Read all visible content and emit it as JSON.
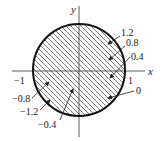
{
  "diagram": {
    "type": "level-curves-disk",
    "axes": {
      "x_label": "x",
      "y_label": "y",
      "tick_labels": {
        "pos_x": "1",
        "neg_x": "−1"
      }
    },
    "region": {
      "shape": "circle",
      "hatched": true,
      "center": [
        0,
        0
      ],
      "radius": 1
    },
    "level_labels_right": [
      "1.2",
      "0.8",
      "0.4",
      "0"
    ],
    "level_labels_left": [
      "−0.8",
      "−1.2",
      "−0.4"
    ],
    "colors": {
      "stroke": "#222222",
      "background": "#ffffff"
    }
  }
}
